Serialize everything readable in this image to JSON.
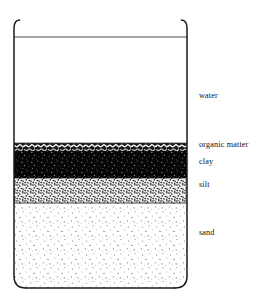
{
  "figure": {
    "container": "beaker"
  },
  "beaker": {
    "left_x": 14,
    "right_x": 187,
    "rim_top_y": 20,
    "bottom_y": 288,
    "water_surface_y": 37,
    "corner_radius": 12
  },
  "layers": [
    {
      "id": "water",
      "label": "water",
      "fill": "#ffffff",
      "texture": "none",
      "top_y": 37,
      "bottom_y": 143
    },
    {
      "id": "organic-matter",
      "label": "organic matter",
      "fill": "#1c1c1c",
      "texture": "coarse-speckle",
      "top_y": 143,
      "bottom_y": 151
    },
    {
      "id": "clay",
      "label": "clay",
      "fill": "#080808",
      "texture": "fine-speckle",
      "top_y": 151,
      "bottom_y": 178
    },
    {
      "id": "silt",
      "label": "silt",
      "fill": "#f2f2f2",
      "texture": "dense-stipple",
      "top_y": 178,
      "bottom_y": 203
    },
    {
      "id": "sand",
      "label": "sand",
      "fill": "#ffffff",
      "texture": "sparse-dots",
      "top_y": 203,
      "bottom_y": 288
    }
  ],
  "colors": {
    "outline": "#1a1a1a",
    "label_text": "#111111",
    "background": "#ffffff",
    "dark_sediment": "#0a0a0a",
    "light_sediment": "#f4f4f4"
  }
}
